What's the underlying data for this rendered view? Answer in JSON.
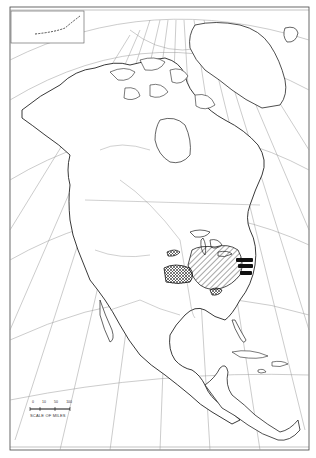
{
  "map": {
    "subject": "North America outline map",
    "style": "black-and-white line map with graticule",
    "colors": {
      "background": "#ffffff",
      "ink": "#222222",
      "graticule": "#999999",
      "fill_dense": "#111111",
      "fill_stipple": "#555555"
    },
    "regions": [
      {
        "name": "hatched-region-great-lakes-ohio",
        "pattern": "diagonal-hatch"
      },
      {
        "name": "stippled-region-plains",
        "pattern": "crosshatch-dark"
      },
      {
        "name": "solid-region-mid-atlantic",
        "pattern": "solid-black-bands"
      },
      {
        "name": "small-region-kansas",
        "pattern": "stipple"
      },
      {
        "name": "small-region-tennessee",
        "pattern": "crosshatch"
      }
    ],
    "inset": {
      "label": "Aleutian Islands inset"
    },
    "scale_bar": {
      "ticks": [
        "0",
        "10",
        "50",
        "100"
      ],
      "label": "SCALE OF MILES"
    }
  }
}
